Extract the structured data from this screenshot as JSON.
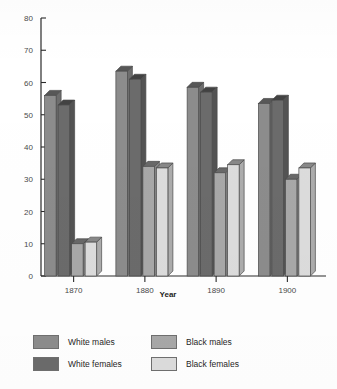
{
  "chart_data": {
    "type": "bar",
    "title": "",
    "subtitle": "",
    "xlabel": "Year",
    "ylabel": "",
    "categories": [
      "1870",
      "1880",
      "1890",
      "1900"
    ],
    "series": [
      {
        "name": "White males",
        "color": "#8c8c8c",
        "values": [
          56,
          63.5,
          58.5,
          53.5
        ]
      },
      {
        "name": "White females",
        "color": "#6b6b6b",
        "values": [
          53,
          61,
          57,
          54.5
        ]
      },
      {
        "name": "Black males",
        "color": "#a8a8a8",
        "values": [
          10,
          34,
          32,
          30
        ]
      },
      {
        "name": "Black females",
        "color": "#dcdcdc",
        "values": [
          10.5,
          33.5,
          34.5,
          33.5
        ]
      }
    ],
    "ylim": [
      0,
      80
    ],
    "yticks": [
      0,
      10,
      20,
      30,
      40,
      50,
      60,
      70,
      80
    ],
    "ytick_labels": [
      "0",
      "10",
      "20",
      "30",
      "40",
      "50",
      "60",
      "70",
      "80"
    ],
    "grid": false,
    "legend_position": "bottom",
    "style": "3d-bars"
  },
  "legend": {
    "entries": [
      {
        "label": "White males",
        "swatch": "#8c8c8c"
      },
      {
        "label": "Black males",
        "swatch": "#a8a8a8"
      },
      {
        "label": "White females",
        "swatch": "#6b6b6b"
      },
      {
        "label": "Black females",
        "swatch": "#dcdcdc"
      }
    ]
  },
  "axis": {
    "x_title": "Year",
    "y_tick_labels": [
      "80",
      "70",
      "60",
      "50",
      "40",
      "30",
      "20",
      "10",
      "0"
    ],
    "x_tick_labels": [
      "1870",
      "1880",
      "1890",
      "1900"
    ]
  }
}
